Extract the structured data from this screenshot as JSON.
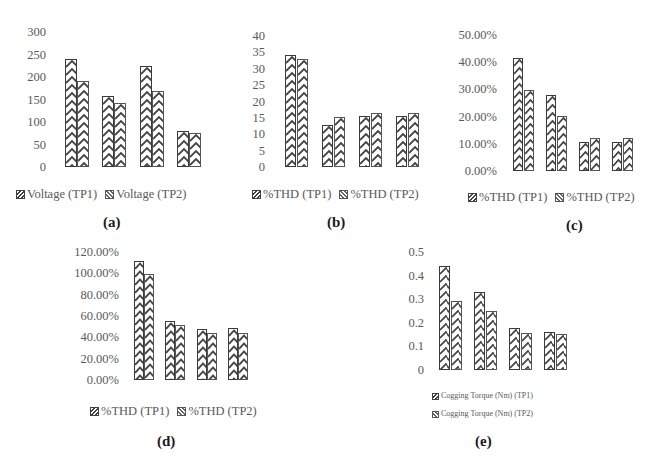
{
  "chart_data": [
    {
      "id": "a",
      "type": "bar",
      "caption": "(a)",
      "title": "",
      "xlabel": "",
      "ylabel": "",
      "categories": [
        "(illegible) 1",
        "(illegible) 2",
        "(illegible) 3",
        "(illegible) 4"
      ],
      "series": [
        {
          "name": "Voltage (TP1)",
          "values": [
            240,
            158,
            224,
            80
          ]
        },
        {
          "name": "Voltage (TP2)",
          "values": [
            191,
            143,
            170,
            76
          ]
        }
      ],
      "yticks": [
        "300",
        "250",
        "200",
        "150",
        "100",
        "50",
        "0"
      ],
      "ylim": [
        0,
        300
      ],
      "grid": false,
      "legend_position": "bottom"
    },
    {
      "id": "b",
      "type": "bar",
      "caption": "(b)",
      "title": "",
      "xlabel": "",
      "ylabel": "",
      "categories": [
        "(illegible) 1",
        "(illegible) 2",
        "(illegible) 3",
        "(illegible) 4"
      ],
      "series": [
        {
          "name": "%THD (TP1)",
          "values": [
            34.3,
            12.8,
            15.6,
            15.6
          ]
        },
        {
          "name": "%THD (TP2)",
          "values": [
            32.9,
            15.4,
            16.6,
            16.6
          ]
        }
      ],
      "yticks": [
        "40",
        "35",
        "30",
        "25",
        "20",
        "15",
        "10",
        "5",
        "0"
      ],
      "ylim": [
        0,
        40
      ],
      "grid": false,
      "legend_position": "bottom"
    },
    {
      "id": "c",
      "type": "bar",
      "caption": "(c)",
      "title": "",
      "xlabel": "",
      "ylabel": "",
      "categories": [
        "(illegible) 1",
        "(illegible) 2",
        "(illegible) 3",
        "(illegible) 4"
      ],
      "series": [
        {
          "name": "%THD (TP1)",
          "values": [
            41.5,
            28.0,
            10.7,
            10.8
          ]
        },
        {
          "name": "%THD (TP2)",
          "values": [
            29.7,
            20.4,
            12.2,
            12.0
          ]
        }
      ],
      "yticks": [
        "50.00%",
        "40.00%",
        "30.00%",
        "20.00%",
        "10.00%",
        "0.00%"
      ],
      "ylim": [
        0,
        50
      ],
      "grid": false,
      "legend_position": "bottom"
    },
    {
      "id": "d",
      "type": "bar",
      "caption": "(d)",
      "title": "",
      "xlabel": "",
      "ylabel": "",
      "categories": [
        "(illegible) 1",
        "(illegible) 2",
        "(illegible) 3",
        "(illegible) 4"
      ],
      "series": [
        {
          "name": "%THD (TP1)",
          "values": [
            111.5,
            55,
            48,
            49
          ]
        },
        {
          "name": "%THD (TP2)",
          "values": [
            99,
            52,
            44.5,
            44
          ]
        }
      ],
      "yticks": [
        "120.00%",
        "100.00%",
        "80.00%",
        "60.00%",
        "40.00%",
        "20.00%",
        "0.00%"
      ],
      "ylim": [
        0,
        120
      ],
      "grid": false,
      "legend_position": "bottom"
    },
    {
      "id": "e",
      "type": "bar",
      "caption": "(e)",
      "title": "",
      "xlabel": "",
      "ylabel": "",
      "categories": [
        "(illegible) 1",
        "(illegible) 2",
        "(illegible) 3",
        "(illegible) 4"
      ],
      "series": [
        {
          "name": "Cogging Torque (Nm) (TP1)",
          "values": [
            0.441,
            0.33,
            0.176,
            0.163
          ]
        },
        {
          "name": "Cogging Torque (Nm) (TP2)",
          "values": [
            0.293,
            0.249,
            0.156,
            0.152
          ]
        }
      ],
      "yticks": [
        "0.5",
        "0.4",
        "0.3",
        "0.2",
        "0.1",
        "0"
      ],
      "ylim": [
        0,
        0.5
      ],
      "grid": false,
      "legend_position": "bottom"
    }
  ],
  "layout": {
    "a": {
      "ylabels_right": 46,
      "ytop": 32,
      "ybot": 167,
      "plot_left": 58,
      "plot_width": 150,
      "legend_x": 16,
      "legend_y": 187,
      "caption_x": 103,
      "caption_y": 214
    },
    "b": {
      "ylabels_right": 265,
      "ytop": 36,
      "ybot": 167,
      "plot_left": 278,
      "plot_width": 148,
      "legend_x": 252,
      "legend_y": 187,
      "caption_x": 327,
      "caption_y": 214
    },
    "c": {
      "ylabels_right": 497,
      "ytop": 35,
      "ybot": 171,
      "plot_left": 507,
      "plot_width": 132,
      "legend_x": 468,
      "legend_y": 190,
      "caption_x": 566,
      "caption_y": 217
    },
    "d": {
      "ylabels_right": 119,
      "ytop": 252,
      "ybot": 380,
      "plot_left": 128,
      "plot_width": 126,
      "legend_x": 90,
      "legend_y": 404,
      "caption_x": 157,
      "caption_y": 433
    },
    "e": {
      "ylabels_right": 424,
      "ytop": 252,
      "ybot": 370,
      "plot_left": 433,
      "plot_width": 140,
      "legend_x": 432,
      "legend_y": 391,
      "caption_x": 475,
      "caption_y": 433
    }
  }
}
